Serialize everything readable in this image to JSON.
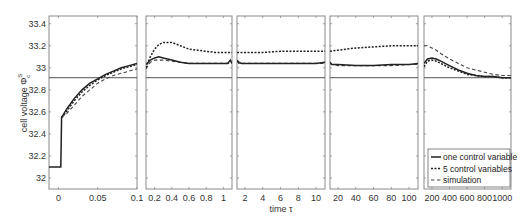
{
  "chart_data": {
    "type": "line",
    "title": "",
    "ylabel": "cell voltage Φ_c^S",
    "xlabel": "time τ",
    "ylim": [
      31.9,
      33.47
    ],
    "yticks": [
      32,
      32.2,
      32.4,
      32.6,
      32.8,
      33,
      33.2,
      33.4
    ],
    "ytick_labels": [
      "32",
      "32.2",
      "32.4",
      "32.6",
      "32.8",
      "33",
      "33.2",
      "33.4"
    ],
    "reference_line": 32.91,
    "grid": false,
    "legend_position": "lower right (last panel)",
    "legend": [
      "one control variable",
      "5 control variables",
      "simulation"
    ],
    "panels": [
      {
        "xlim": [
          -0.012,
          0.1
        ],
        "xticks": [
          0,
          0.05,
          0.1
        ],
        "xtick_labels": [
          "0",
          "0.05",
          "0.1"
        ],
        "series": [
          {
            "name": "one control variable",
            "x": [
              -0.012,
              0.003,
              0.004,
              0.01,
              0.02,
              0.03,
              0.04,
              0.05,
              0.06,
              0.07,
              0.08,
              0.09,
              0.1
            ],
            "y": [
              32.1,
              32.1,
              32.55,
              32.62,
              32.72,
              32.8,
              32.86,
              32.9,
              32.94,
              32.97,
              33.0,
              33.02,
              33.04
            ]
          },
          {
            "name": "5 control variables",
            "x": [
              0.004,
              0.01,
              0.02,
              0.03,
              0.04,
              0.05,
              0.06,
              0.07,
              0.08,
              0.09,
              0.1
            ],
            "y": [
              32.55,
              32.6,
              32.7,
              32.78,
              32.84,
              32.89,
              32.93,
              32.96,
              32.99,
              33.01,
              33.03
            ]
          },
          {
            "name": "simulation",
            "x": [
              0.004,
              0.01,
              0.02,
              0.03,
              0.04,
              0.05,
              0.06,
              0.07,
              0.08,
              0.09,
              0.1
            ],
            "y": [
              32.55,
              32.58,
              32.66,
              32.74,
              32.8,
              32.86,
              32.9,
              32.93,
              32.95,
              32.97,
              32.99
            ]
          }
        ]
      },
      {
        "xlim": [
          0.1,
          1.1
        ],
        "xticks": [
          0.2,
          0.4,
          0.6,
          0.8,
          1
        ],
        "xtick_labels": [
          "0.2",
          "0.4",
          "0.6",
          "0.8",
          "1"
        ],
        "series": [
          {
            "name": "one control variable",
            "x": [
              0.1,
              0.15,
              0.2,
              0.25,
              0.3,
              0.4,
              0.5,
              0.6,
              0.7,
              0.8,
              0.9,
              1.0,
              1.05,
              1.08,
              1.1
            ],
            "y": [
              33.03,
              33.07,
              33.09,
              33.1,
              33.09,
              33.07,
              33.05,
              33.04,
              33.04,
              33.04,
              33.04,
              33.04,
              33.04,
              33.07,
              33.04
            ]
          },
          {
            "name": "5 control variables",
            "x": [
              0.1,
              0.15,
              0.2,
              0.25,
              0.3,
              0.4,
              0.5,
              0.6,
              0.7,
              0.8,
              0.9,
              1.0,
              1.1
            ],
            "y": [
              33.0,
              33.1,
              33.17,
              33.21,
              33.23,
              33.23,
              33.2,
              33.17,
              33.16,
              33.15,
              33.14,
              33.14,
              33.14
            ]
          },
          {
            "name": "simulation",
            "x": [
              0.1,
              0.12,
              0.15,
              0.2,
              0.3,
              0.4,
              0.6,
              0.8,
              1.0,
              1.1
            ],
            "y": [
              32.99,
              33.02,
              33.05,
              33.07,
              33.07,
              33.06,
              33.04,
              33.04,
              33.04,
              33.04
            ]
          }
        ]
      },
      {
        "xlim": [
          1.1,
          11
        ],
        "xticks": [
          2,
          4,
          6,
          8,
          10
        ],
        "xtick_labels": [
          "2",
          "4",
          "6",
          "8",
          "10"
        ],
        "series": [
          {
            "name": "one control variable",
            "x": [
              1.1,
              1.3,
              1.6,
              2,
              4,
              6,
              8,
              10,
              11
            ],
            "y": [
              33.07,
              33.05,
              33.04,
              33.04,
              33.04,
              33.04,
              33.04,
              33.04,
              33.05
            ]
          },
          {
            "name": "5 control variables",
            "x": [
              1.1,
              2,
              4,
              6,
              8,
              10,
              11
            ],
            "y": [
              33.14,
              33.14,
              33.14,
              33.15,
              33.15,
              33.15,
              33.15
            ]
          },
          {
            "name": "simulation",
            "x": [
              1.1,
              1.3,
              1.6,
              2,
              4,
              6,
              8,
              10,
              11
            ],
            "y": [
              33.06,
              33.04,
              33.04,
              33.04,
              33.04,
              33.04,
              33.04,
              33.04,
              33.04
            ]
          }
        ]
      },
      {
        "xlim": [
          11,
          110
        ],
        "xticks": [
          20,
          40,
          60,
          80,
          100
        ],
        "xtick_labels": [
          "20",
          "40",
          "60",
          "80",
          "100"
        ],
        "series": [
          {
            "name": "one control variable",
            "x": [
              11,
              13,
              16,
              20,
              40,
              60,
              80,
              100,
              110
            ],
            "y": [
              33.05,
              33.03,
              33.03,
              33.03,
              33.02,
              33.02,
              33.03,
              33.03,
              33.04
            ]
          },
          {
            "name": "5 control variables",
            "x": [
              11,
              20,
              40,
              60,
              80,
              100,
              110
            ],
            "y": [
              33.15,
              33.16,
              33.18,
              33.19,
              33.2,
              33.2,
              33.2
            ]
          },
          {
            "name": "simulation",
            "x": [
              11,
              13,
              16,
              20,
              40,
              60,
              80,
              100,
              110
            ],
            "y": [
              33.04,
              33.03,
              33.03,
              33.02,
              33.02,
              33.02,
              33.02,
              33.03,
              33.03
            ]
          }
        ]
      },
      {
        "xlim": [
          110,
          1100
        ],
        "xticks": [
          200,
          400,
          600,
          800,
          1000
        ],
        "xtick_labels": [
          "200",
          "400",
          "600",
          "800",
          "1000"
        ],
        "series": [
          {
            "name": "one control variable",
            "x": [
              110,
              150,
              200,
              250,
              300,
              400,
              500,
              600,
              700,
              800,
              900,
              1000,
              1100
            ],
            "y": [
              33.04,
              33.08,
              33.09,
              33.08,
              33.06,
              33.02,
              32.98,
              32.95,
              32.93,
              32.92,
              32.92,
              32.91,
              32.91
            ]
          },
          {
            "name": "5 control variables",
            "x": [
              110,
              150,
              200,
              250,
              300,
              400,
              500,
              600,
              700,
              800,
              900,
              1000,
              1100
            ],
            "y": [
              33.01,
              33.06,
              33.07,
              33.06,
              33.04,
              33.0,
              32.97,
              32.94,
              32.93,
              32.92,
              32.92,
              32.91,
              32.91
            ]
          },
          {
            "name": "simulation",
            "x": [
              110,
              150,
              200,
              250,
              300,
              400,
              500,
              600,
              700,
              800,
              900,
              1000,
              1100
            ],
            "y": [
              33.2,
              33.2,
              33.18,
              33.16,
              33.13,
              33.08,
              33.04,
              33.0,
              32.98,
              32.96,
              32.94,
              32.93,
              32.93
            ]
          }
        ]
      }
    ]
  },
  "layout_panels": [
    {
      "left": 49,
      "right": 137
    },
    {
      "left": 146,
      "right": 232
    },
    {
      "left": 237,
      "right": 325
    },
    {
      "left": 330,
      "right": 418
    },
    {
      "left": 424,
      "right": 511
    }
  ],
  "plot_top": 16,
  "plot_bottom": 189,
  "labels": {
    "ylabel_text": "cell voltage Φ",
    "ylabel_sup": "S",
    "ylabel_sub": "c",
    "xlabel": "time τ"
  },
  "legend": {
    "items": [
      {
        "label": "one control variable",
        "style": "solid"
      },
      {
        "label": "5 control variables",
        "style": "dotted"
      },
      {
        "label": "simulation",
        "style": "dashed"
      }
    ]
  }
}
